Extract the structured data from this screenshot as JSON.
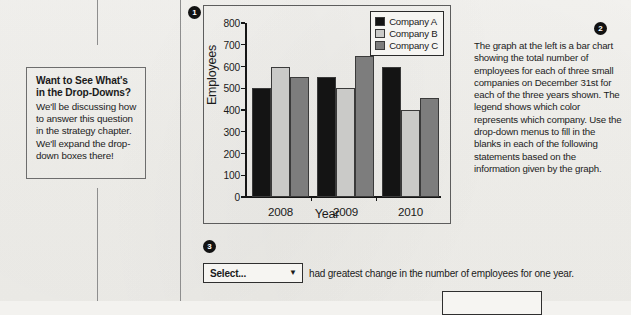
{
  "callout": {
    "title_line1": "Want to See What's",
    "title_line2": "in the Drop-Downs?",
    "body": "We'll be discussing how to answer this question in the strategy chapter. We'll expand the drop-down boxes there!"
  },
  "badges": {
    "one": "1",
    "two": "2",
    "three": "3"
  },
  "description": {
    "text": "The graph at the left is a bar chart showing the total number of employees for each of three small companies on December 31st for each of the three years shown. The legend shows which color represents which company. Use the drop-down menus to fill in the blanks in each of the following statements based on the information given by the graph."
  },
  "question": {
    "dropdown_value": "Select...",
    "caret": "▼",
    "statement": "had greatest change in the number of employees for one year."
  },
  "colors": {
    "company_a": "#141414",
    "company_b": "#cacac8",
    "company_c": "#7d7d7d",
    "paper": "#f3f2ef",
    "ink": "#161616"
  },
  "chart_data": {
    "type": "bar",
    "title": "",
    "xlabel": "Year",
    "ylabel": "Employees",
    "categories": [
      "2008",
      "2009",
      "2010"
    ],
    "series": [
      {
        "name": "Company A",
        "color": "#141414",
        "values": [
          500,
          550,
          600
        ]
      },
      {
        "name": "Company B",
        "color": "#cacac8",
        "values": [
          600,
          500,
          400
        ]
      },
      {
        "name": "Company C",
        "color": "#7d7d7d",
        "values": [
          550,
          650,
          455
        ]
      }
    ],
    "ylim": [
      0,
      800
    ],
    "yticks": [
      0,
      100,
      200,
      300,
      400,
      500,
      600,
      700,
      800
    ],
    "ytick_labels": [
      "0",
      "100",
      "200",
      "300",
      "400",
      "500",
      "600",
      "700",
      "800"
    ],
    "grid": false,
    "legend_position": "top-right",
    "legend_entries": [
      "Company A",
      "Company B",
      "Company C"
    ]
  }
}
